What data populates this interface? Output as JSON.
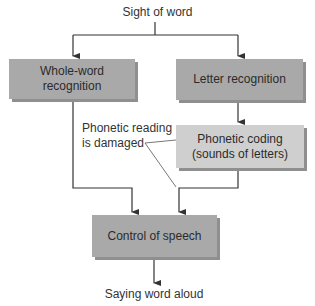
{
  "diagram": {
    "top_label": "Sight of word",
    "bottom_label": "Saying word aloud",
    "nodes": {
      "whole_word": "Whole-word recognition",
      "letter": "Letter recognition",
      "phonetic_line1": "Phonetic coding",
      "phonetic_line2": "(sounds of letters)",
      "speech": "Control of speech"
    },
    "annotation_line1": "Phonetic reading",
    "annotation_line2": "is damaged",
    "colors": {
      "dark_box": "#a9a9a9",
      "light_box": "#cfcfcf",
      "shadow": "#8f8f8f",
      "line": "#333333"
    }
  }
}
